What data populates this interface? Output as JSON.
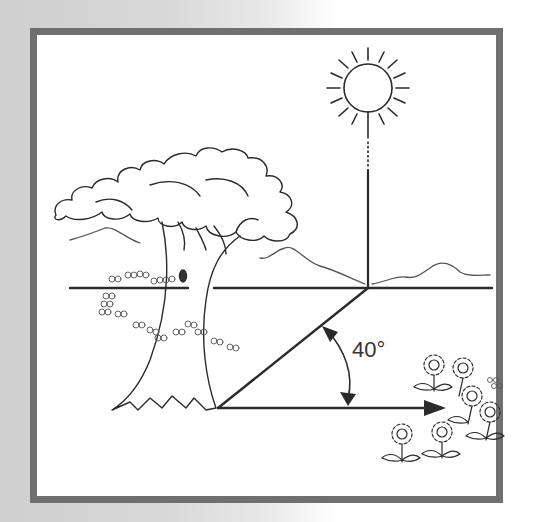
{
  "diagram": {
    "type": "sun-angle-illustration",
    "elements": [
      "sun",
      "tree",
      "hills",
      "horizon-line",
      "flowers",
      "shadow-line",
      "angle-arc"
    ],
    "angle_label": "40°",
    "colors": {
      "frame": "#6f6f6f",
      "line": "#2a2a2a",
      "background": "#ffffff"
    }
  }
}
